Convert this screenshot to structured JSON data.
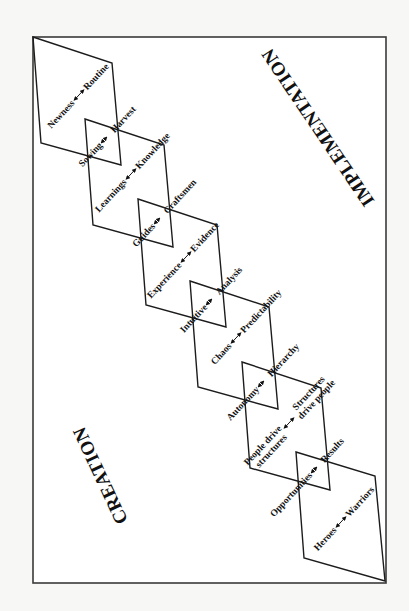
{
  "diagram": {
    "titles": {
      "implementation": "IMPLEMENTATION",
      "creation": "CREATION"
    },
    "arrow_glyph": "←—→",
    "shape_pairs": [
      {
        "left": "Newness",
        "right": "Routine"
      },
      {
        "left": "Learnings",
        "right": "Knowledge"
      },
      {
        "left": "Experience",
        "right": "Evidence"
      },
      {
        "left": "Chaos",
        "right": "Predictability"
      },
      {
        "left_line1": "People drive",
        "left_line2": "structures",
        "right_line1": "Structures",
        "right_line2": "drive people"
      },
      {
        "left": "Heroes",
        "right": "Warriors"
      }
    ],
    "crossing_pairs": [
      {
        "left": "Sowing",
        "right": "Harvest"
      },
      {
        "left": "Guides",
        "right": "Craftsmen"
      },
      {
        "left": "Intuitive",
        "right": "Analysis"
      },
      {
        "left": "Autonomy",
        "right": "Hierarchy"
      },
      {
        "left": "Opportunities",
        "right": "Results"
      }
    ],
    "colors": {
      "line": "#1c1c1c",
      "frame": "#3a3a3a",
      "background": "#ffffff",
      "text": "#111111"
    }
  }
}
